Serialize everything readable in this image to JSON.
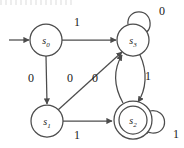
{
  "figure": {
    "type": "state-transition-diagram",
    "title": "",
    "stroke_color": "#4c4c4c",
    "text_color": "#1a1a1a",
    "background": "#ffffff"
  },
  "states": [
    {
      "id": "s0",
      "label": "s",
      "sub": "0",
      "cx": 46,
      "cy": 40,
      "r": 16,
      "accepting": false,
      "start": true
    },
    {
      "id": "s3",
      "label": "s",
      "sub": "3",
      "cx": 133,
      "cy": 40,
      "r": 16,
      "accepting": false,
      "start": false
    },
    {
      "id": "s1",
      "label": "s",
      "sub": "1",
      "cx": 47,
      "cy": 121,
      "r": 16,
      "accepting": false,
      "start": false
    },
    {
      "id": "s2",
      "label": "s",
      "sub": "2",
      "cx": 133,
      "cy": 120,
      "r": 19,
      "accepting": true,
      "start": false
    }
  ],
  "transitions": [
    {
      "id": "t1",
      "from": "s0",
      "to": "s3",
      "symbol": "1",
      "label_x": 77,
      "label_y": 22
    },
    {
      "id": "t2",
      "from": "s0",
      "to": "s1",
      "symbol": "0",
      "label_x": 31,
      "label_y": 78
    },
    {
      "id": "t3",
      "from": "s1",
      "to": "s3",
      "symbol": "0",
      "label_x": 70,
      "label_y": 78
    },
    {
      "id": "t4",
      "from": "s2",
      "to": "s3",
      "symbol": "0",
      "label_x": 95,
      "label_y": 78
    },
    {
      "id": "t5",
      "from": "s3",
      "to": "s2",
      "symbol": "1",
      "label_x": 148,
      "label_y": 76
    },
    {
      "id": "t6",
      "from": "s1",
      "to": "s2",
      "symbol": "1",
      "label_x": 77,
      "label_y": 135
    },
    {
      "id": "t7",
      "from": "s3",
      "to": "s3",
      "symbol": "0",
      "label_x": 162,
      "label_y": 11,
      "self_loop": true
    },
    {
      "id": "t8",
      "from": "s2",
      "to": "s2",
      "symbol": "1",
      "label_x": 176,
      "label_y": 134,
      "self_loop": true
    }
  ],
  "start_arrow": {
    "x1": 9,
    "y1": 40,
    "x2": 29,
    "y2": 40
  },
  "alphabet": [
    "0",
    "1"
  ],
  "accepting_states": [
    "s2"
  ],
  "start_state": "s0"
}
